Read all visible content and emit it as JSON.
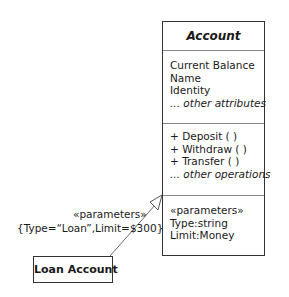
{
  "diagram": {
    "class": {
      "name": "Account",
      "attributes": [
        "Current Balance",
        "Name",
        "Identity"
      ],
      "attributes_more": "... other attributes",
      "operations": [
        "+ Deposit ( )",
        "+ Withdraw ( )",
        "+ Transfer ( )"
      ],
      "operations_more": "... other operations",
      "parameters": {
        "stereotype": "«parameters»",
        "items": [
          "Type:string",
          "Limit:Money"
        ]
      }
    },
    "binding": {
      "stereotype": "«parameters»",
      "values": "{Type=“Loan”,Limit=$300}"
    },
    "bound_class": {
      "name": "Loan Account"
    }
  }
}
